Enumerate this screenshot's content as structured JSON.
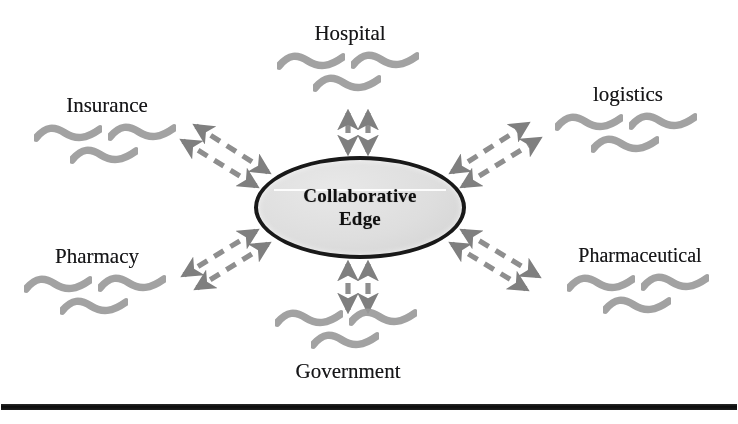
{
  "diagram": {
    "hub": {
      "label_line1": "Collaborative",
      "label_line2": "Edge",
      "fill_color": "#dcdcdc",
      "border_color": "#1b1b1b"
    },
    "nodes": [
      {
        "id": "hospital",
        "label": "Hospital",
        "position": "top",
        "squiggle_count": 3,
        "squiggle_color": "#9a9a9a"
      },
      {
        "id": "logistics",
        "label": "logistics",
        "position": "top-right",
        "squiggle_count": 3,
        "squiggle_color": "#9a9a9a"
      },
      {
        "id": "pharmaceutical",
        "label": "Pharmaceutical",
        "position": "bottom-right",
        "squiggle_count": 3,
        "squiggle_color": "#9a9a9a"
      },
      {
        "id": "government",
        "label": "Government",
        "position": "bottom",
        "squiggle_count": 3,
        "squiggle_color": "#9a9a9a"
      },
      {
        "id": "pharmacy",
        "label": "Pharmacy",
        "position": "bottom-left",
        "squiggle_count": 3,
        "squiggle_color": "#9a9a9a"
      },
      {
        "id": "insurance",
        "label": "Insurance",
        "position": "top-left",
        "squiggle_count": 3,
        "squiggle_color": "#9a9a9a"
      }
    ],
    "connectors": {
      "style": "dashed",
      "color": "#8e8e8e",
      "arrowheads": "both-ends",
      "pairs_per_node": 2,
      "count": 6
    },
    "bottom_rule": {
      "color": "#131313"
    }
  }
}
